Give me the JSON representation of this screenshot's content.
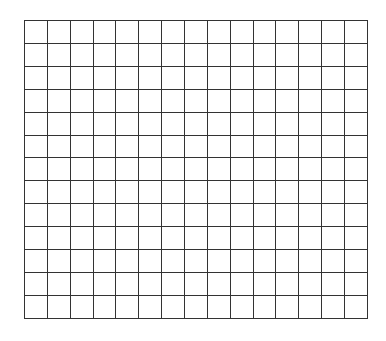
{
  "grid": {
    "columns": 15,
    "rows": 13,
    "cell_width": 22.87,
    "cell_height": 22.92,
    "line_color": "#333333",
    "background_color": "#ffffff"
  }
}
